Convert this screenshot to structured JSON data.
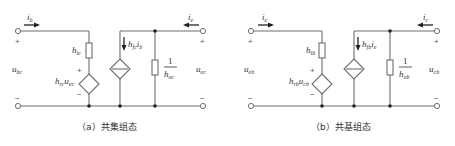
{
  "figure": {
    "panels": [
      {
        "id": "a",
        "caption": "（a）共集组态",
        "input_current": {
          "base": "i",
          "sub": "b"
        },
        "output_current": {
          "base": "i",
          "sub": "e"
        },
        "input_voltage": {
          "base": "u",
          "sub": "bc"
        },
        "output_voltage": {
          "base": "u",
          "sub": "ec"
        },
        "input_resistor": {
          "base": "h",
          "sub": "ic"
        },
        "feedback_source": {
          "base": "h",
          "sub": "rc",
          "var": "u",
          "var_sub": "ec"
        },
        "current_source": {
          "base": "h",
          "sub": "fc",
          "var": "i",
          "var_sub": "b"
        },
        "output_conductance": {
          "numerator": "1",
          "base": "h",
          "sub": "oc"
        },
        "plus_sign": "+",
        "minus_sign": "−"
      },
      {
        "id": "b",
        "caption": "（b）共基组态",
        "input_current": {
          "base": "i",
          "sub": "e"
        },
        "output_current": {
          "base": "i",
          "sub": "c"
        },
        "input_voltage": {
          "base": "u",
          "sub": "eb"
        },
        "output_voltage": {
          "base": "u",
          "sub": "cb"
        },
        "input_resistor": {
          "base": "h",
          "sub": "ib"
        },
        "feedback_source": {
          "base": "h",
          "sub": "rb",
          "var": "u",
          "var_sub": "cb"
        },
        "current_source": {
          "base": "h",
          "sub": "fb",
          "var": "i",
          "var_sub": "e"
        },
        "output_conductance": {
          "numerator": "1",
          "base": "h",
          "sub": "ob"
        },
        "plus_sign": "+",
        "minus_sign": "−"
      }
    ],
    "colors": {
      "wire": "#6e6e6e",
      "node": "#222222",
      "text": "#333333"
    }
  }
}
